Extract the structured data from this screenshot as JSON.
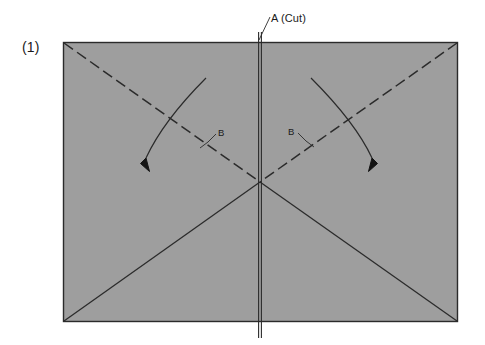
{
  "figure": {
    "step_number": "(1)",
    "cut_label": "A (Cut)",
    "fold_label_left": "B",
    "fold_label_right": "B",
    "colors": {
      "paper_fill": "#9e9e9e",
      "line": "#2b2b2b",
      "background": "#ffffff",
      "text": "#1a1a1a"
    },
    "geometry": {
      "sheet": {
        "left": 63,
        "top": 42,
        "right": 458,
        "bottom": 322
      },
      "center": {
        "x": 260,
        "y": 182
      },
      "cut_line": {
        "x": 260,
        "top": 32,
        "bottom": 338
      },
      "valley_folds": [
        {
          "from": [
            63,
            42
          ],
          "to": [
            260,
            182
          ],
          "style": "dashed"
        },
        {
          "from": [
            458,
            42
          ],
          "to": [
            260,
            182
          ],
          "style": "dashed"
        }
      ],
      "mountain_folds": [
        {
          "from": [
            260,
            182
          ],
          "to": [
            63,
            322
          ],
          "style": "solid"
        },
        {
          "from": [
            260,
            182
          ],
          "to": [
            458,
            322
          ],
          "style": "solid"
        }
      ],
      "arrows": [
        {
          "name": "left-fold-arrow",
          "start": [
            206,
            78
          ],
          "end": [
            143,
            166
          ],
          "direction": "down-left"
        },
        {
          "name": "right-fold-arrow",
          "start": [
            311,
            78
          ],
          "end": [
            375,
            166
          ],
          "direction": "down-right"
        }
      ]
    }
  }
}
